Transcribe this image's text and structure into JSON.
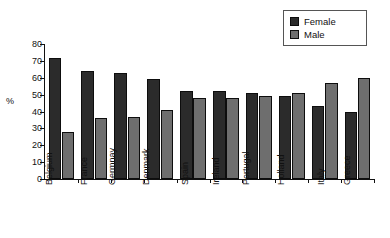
{
  "chart_data": {
    "type": "bar",
    "title": "",
    "xlabel": "",
    "ylabel": "%",
    "ylim": [
      0,
      80
    ],
    "y_ticks": [
      0,
      10,
      20,
      30,
      40,
      50,
      60,
      70,
      80
    ],
    "grid": false,
    "legend_position": "top-right",
    "categories": [
      "Belgium",
      "France",
      "Germnay",
      "Denmark",
      "Spain",
      "Ireland",
      "Portugal",
      "Holland",
      "Italy",
      "Greece"
    ],
    "series": [
      {
        "name": "Female",
        "color": "#2b2b2b",
        "values": [
          72,
          64,
          63,
          59,
          52,
          52,
          51,
          49,
          43,
          40
        ]
      },
      {
        "name": "Male",
        "color": "#6e6e6e",
        "values": [
          28,
          36,
          37,
          41,
          48,
          48,
          49,
          51,
          57,
          60
        ]
      }
    ]
  },
  "legend": {
    "items": [
      {
        "label": "Female"
      },
      {
        "label": "Male"
      }
    ]
  },
  "axes": {
    "y_title": "%"
  }
}
